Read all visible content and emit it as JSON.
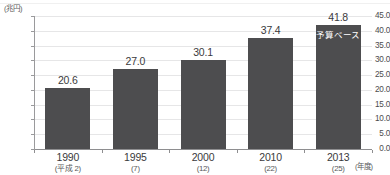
{
  "chart_data": {
    "type": "bar",
    "title": "",
    "subtitle": "",
    "xlabel": "(年度)",
    "ylabel": "(兆円)",
    "ylim": [
      0.0,
      45.0
    ],
    "ytick_step": 5.0,
    "grid": true,
    "legend": "none",
    "categories": [
      "1990",
      "1995",
      "2000",
      "2010",
      "2013"
    ],
    "category_sublabels": [
      "(平成 2)",
      "(7)",
      "(12)",
      "(22)",
      "(25)"
    ],
    "values": [
      20.6,
      27.0,
      30.1,
      37.4,
      41.8
    ],
    "value_labels": [
      "20.6",
      "27.0",
      "30.1",
      "37.4",
      "41.8"
    ],
    "ytick_labels": [
      "45.0",
      "40.0",
      "35.0",
      "30.0",
      "25.0",
      "20.0",
      "15.0",
      "10.0",
      "5.0",
      "0.0"
    ],
    "ytick_values": [
      45.0,
      40.0,
      35.0,
      30.0,
      25.0,
      20.0,
      15.0,
      10.0,
      5.0,
      0.0
    ],
    "annotations": [
      {
        "category": "2013",
        "text": "予算ベース",
        "placement": "inside-bar-top",
        "color": "#ffffff"
      }
    ],
    "series": [
      {
        "name": "",
        "values": [
          20.6,
          27.0,
          30.1,
          37.4,
          41.8
        ]
      }
    ],
    "colors": {
      "bar": "#4d4d4f",
      "grid": "#e6e6e7",
      "axis": "#8e8e90",
      "text": "#3a3a3c",
      "background": "#ffffff",
      "annotation_text": "#ffffff"
    }
  }
}
